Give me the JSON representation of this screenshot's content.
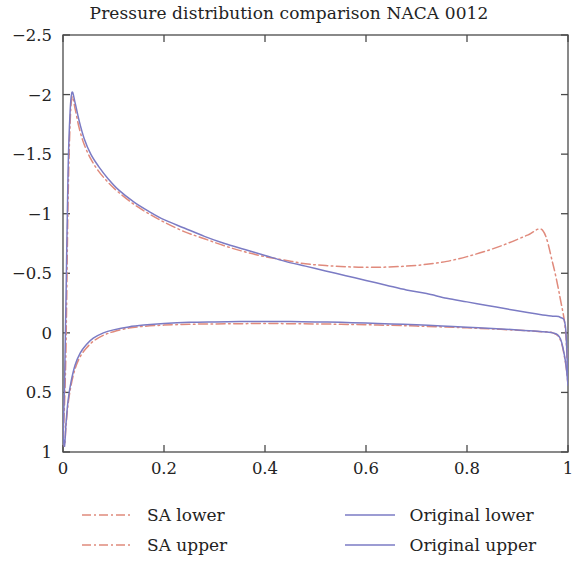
{
  "chart_data": {
    "type": "line",
    "title": "Pressure distribution comparison NACA 0012",
    "xlabel": "",
    "ylabel": "",
    "xlim": [
      0,
      1
    ],
    "ylim": [
      1,
      -2.5
    ],
    "y_inverted": true,
    "grid": false,
    "legend_position": "below-axes",
    "x_ticks": [
      "0",
      "0.2",
      "0.4",
      "0.6",
      "0.8",
      "1"
    ],
    "x_tick_values": [
      0,
      0.2,
      0.4,
      0.6,
      0.8,
      1
    ],
    "y_ticks": [
      "−2.5",
      "−2",
      "−1.5",
      "−1",
      "−0.5",
      "0",
      "0.5",
      "1"
    ],
    "y_tick_values": [
      -2.5,
      -2,
      -1.5,
      -1,
      -0.5,
      0,
      0.5,
      1
    ],
    "colors": {
      "sa": "#E08A7C",
      "original": "#7B7BC4",
      "axis": "#4a4a4a",
      "text": "#232323",
      "background": "#ffffff"
    },
    "series": [
      {
        "name": "SA lower",
        "legend_label": "SA lower",
        "color": "#E08A7C",
        "style": "dashdot",
        "x": [
          0.0,
          0.003,
          0.006,
          0.01,
          0.016,
          0.024,
          0.034,
          0.046,
          0.06,
          0.08,
          0.1,
          0.13,
          0.16,
          0.2,
          0.25,
          0.3,
          0.35,
          0.4,
          0.45,
          0.5,
          0.55,
          0.6,
          0.65,
          0.7,
          0.75,
          0.8,
          0.85,
          0.9,
          0.94,
          0.97,
          0.985,
          0.995,
          1.0
        ],
        "y": [
          0.88,
          0.95,
          0.78,
          0.6,
          0.44,
          0.3,
          0.2,
          0.13,
          0.07,
          0.02,
          -0.01,
          -0.04,
          -0.055,
          -0.065,
          -0.072,
          -0.075,
          -0.077,
          -0.078,
          -0.077,
          -0.075,
          -0.072,
          -0.068,
          -0.063,
          -0.057,
          -0.05,
          -0.042,
          -0.033,
          -0.022,
          -0.012,
          0.0,
          0.06,
          0.25,
          0.43
        ]
      },
      {
        "name": "SA upper",
        "legend_label": "SA upper",
        "color": "#E08A7C",
        "style": "dashdot",
        "x": [
          0.0,
          0.003,
          0.006,
          0.01,
          0.014,
          0.018,
          0.024,
          0.032,
          0.042,
          0.055,
          0.07,
          0.09,
          0.11,
          0.14,
          0.17,
          0.2,
          0.24,
          0.28,
          0.32,
          0.36,
          0.4,
          0.44,
          0.48,
          0.52,
          0.56,
          0.6,
          0.64,
          0.68,
          0.72,
          0.76,
          0.8,
          0.84,
          0.88,
          0.92,
          0.95,
          0.97,
          0.985,
          0.995,
          1.0
        ],
        "y": [
          0.9,
          0.6,
          0.1,
          -1.1,
          -1.75,
          -1.98,
          -1.88,
          -1.72,
          -1.58,
          -1.46,
          -1.36,
          -1.26,
          -1.18,
          -1.08,
          -1.0,
          -0.93,
          -0.85,
          -0.79,
          -0.73,
          -0.68,
          -0.64,
          -0.61,
          -0.58,
          -0.565,
          -0.555,
          -0.55,
          -0.552,
          -0.56,
          -0.575,
          -0.6,
          -0.64,
          -0.69,
          -0.75,
          -0.82,
          -0.86,
          -0.58,
          -0.28,
          -0.02,
          0.41
        ]
      },
      {
        "name": "Original lower",
        "legend_label": "Original lower",
        "color": "#7B7BC4",
        "style": "solid",
        "x": [
          0.0,
          0.003,
          0.006,
          0.01,
          0.016,
          0.024,
          0.034,
          0.046,
          0.06,
          0.08,
          0.1,
          0.13,
          0.16,
          0.2,
          0.25,
          0.3,
          0.35,
          0.4,
          0.45,
          0.5,
          0.55,
          0.6,
          0.65,
          0.7,
          0.75,
          0.8,
          0.85,
          0.9,
          0.94,
          0.97,
          0.985,
          0.995,
          1.0
        ],
        "y": [
          0.86,
          0.95,
          0.76,
          0.57,
          0.41,
          0.27,
          0.17,
          0.1,
          0.045,
          0.0,
          -0.025,
          -0.05,
          -0.065,
          -0.078,
          -0.088,
          -0.092,
          -0.095,
          -0.096,
          -0.095,
          -0.092,
          -0.088,
          -0.082,
          -0.075,
          -0.067,
          -0.058,
          -0.048,
          -0.037,
          -0.025,
          -0.013,
          0.0,
          0.05,
          0.24,
          0.44
        ]
      },
      {
        "name": "Original upper",
        "legend_label": "Original upper",
        "color": "#7B7BC4",
        "style": "solid",
        "x": [
          0.0,
          0.003,
          0.006,
          0.01,
          0.014,
          0.018,
          0.024,
          0.032,
          0.042,
          0.055,
          0.07,
          0.09,
          0.11,
          0.14,
          0.17,
          0.2,
          0.24,
          0.28,
          0.32,
          0.36,
          0.4,
          0.44,
          0.48,
          0.52,
          0.56,
          0.6,
          0.64,
          0.68,
          0.72,
          0.76,
          0.8,
          0.84,
          0.88,
          0.92,
          0.95,
          0.97,
          0.985,
          0.995,
          1.0
        ],
        "y": [
          0.9,
          0.45,
          -0.3,
          -1.35,
          -1.85,
          -2.02,
          -1.93,
          -1.78,
          -1.63,
          -1.5,
          -1.4,
          -1.29,
          -1.2,
          -1.1,
          -1.02,
          -0.95,
          -0.88,
          -0.81,
          -0.75,
          -0.7,
          -0.65,
          -0.6,
          -0.56,
          -0.52,
          -0.48,
          -0.44,
          -0.4,
          -0.36,
          -0.33,
          -0.29,
          -0.26,
          -0.23,
          -0.2,
          -0.17,
          -0.15,
          -0.14,
          -0.13,
          -0.05,
          0.43
        ]
      }
    ]
  },
  "legend": {
    "items": [
      {
        "label": "SA lower",
        "color": "#E08A7C",
        "style": "dashdot"
      },
      {
        "label": "Original lower",
        "color": "#7B7BC4",
        "style": "solid"
      },
      {
        "label": "SA upper",
        "color": "#E08A7C",
        "style": "dashdot"
      },
      {
        "label": "Original upper",
        "color": "#7B7BC4",
        "style": "solid"
      }
    ]
  }
}
